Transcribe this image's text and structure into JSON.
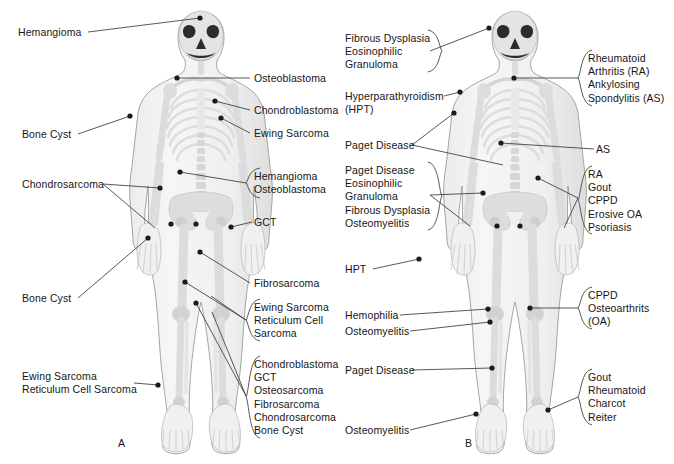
{
  "figure": {
    "panels": [
      {
        "id": "A",
        "letter": "A",
        "letter_pos": [
          118,
          437
        ],
        "subject": "Common sites of primary bone tumors",
        "labels": [
          {
            "name": "hemangioma-skull",
            "lines": [
              "Hemangioma"
            ],
            "x": 18,
            "y": 26,
            "align": "left",
            "brace": false,
            "leader": [
              [
                88,
                32
              ],
              [
                200,
                18
              ]
            ],
            "dots": [
              [
                200,
                18
              ]
            ]
          },
          {
            "name": "osteoblastoma-spine",
            "lines": [
              "Osteoblastoma"
            ],
            "x": 254,
            "y": 72,
            "align": "left",
            "brace": false,
            "leader": [
              [
                250,
                78
              ],
              [
                177,
                78
              ]
            ],
            "dots": [
              [
                177,
                78
              ]
            ]
          },
          {
            "name": "chondroblastoma-humerus",
            "lines": [
              "Chondroblastoma"
            ],
            "x": 254,
            "y": 104,
            "align": "left",
            "brace": false,
            "leader": [
              [
                250,
                110
              ],
              [
                215,
                101
              ]
            ],
            "dots": [
              [
                215,
                101
              ]
            ]
          },
          {
            "name": "ewing-sarcoma-humerus",
            "lines": [
              "Ewing Sarcoma"
            ],
            "x": 254,
            "y": 127,
            "align": "left",
            "brace": false,
            "leader": [
              [
                250,
                133
              ],
              [
                221,
                118
              ]
            ],
            "dots": [
              [
                221,
                118
              ]
            ]
          },
          {
            "name": "bone-cyst-proximal-humerus",
            "lines": [
              "Bone Cyst"
            ],
            "x": 22,
            "y": 128,
            "align": "left",
            "brace": false,
            "leader": [
              [
                78,
                134
              ],
              [
                130,
                116
              ]
            ],
            "dots": [
              [
                130,
                116
              ]
            ]
          },
          {
            "name": "hemangioma-osteoblastoma-spine",
            "lines": [
              "Hemangioma",
              "Osteoblastoma"
            ],
            "x": 254,
            "y": 170,
            "align": "left",
            "brace": true,
            "brace_box": [
              246,
              168,
              14,
              30
            ],
            "leader": [
              [
                246,
                183
              ],
              [
                180,
                172
              ]
            ],
            "dots": [
              [
                180,
                172
              ]
            ]
          },
          {
            "name": "chondrosarcoma-pelvis",
            "lines": [
              "Chondrosarcoma"
            ],
            "x": 22,
            "y": 178,
            "align": "left",
            "brace": false,
            "leader": [
              [
                103,
                184
              ],
              [
                160,
                188
              ]
            ],
            "dots": [
              [
                160,
                188
              ]
            ],
            "extra_leaders": [
              [
                [
                  103,
                  184
                ],
                [
                  155,
                  228
                ]
              ]
            ]
          },
          {
            "name": "gct-distal-radius",
            "lines": [
              "GCT"
            ],
            "x": 254,
            "y": 216,
            "align": "left",
            "brace": false,
            "leader": [
              [
                252,
                222
              ],
              [
                231,
                227
              ]
            ],
            "dots": [
              [
                231,
                227
              ]
            ]
          },
          {
            "name": "bone-cyst-femur",
            "lines": [
              "Bone Cyst"
            ],
            "x": 22,
            "y": 292,
            "align": "left",
            "brace": false,
            "leader": [
              [
                78,
                298
              ],
              [
                148,
                238
              ]
            ],
            "dots": [
              [
                148,
                238
              ]
            ]
          },
          {
            "name": "fibrosarcoma-femur",
            "lines": [
              "Fibrosarcoma"
            ],
            "x": 254,
            "y": 277,
            "align": "left",
            "brace": false,
            "leader": [
              [
                250,
                283
              ],
              [
                200,
                252
              ]
            ],
            "dots": [
              [
                200,
                252
              ]
            ]
          },
          {
            "name": "ewing-reticulum-femur",
            "lines": [
              "Ewing Sarcoma",
              "Reticulum Cell",
              "Sarcoma"
            ],
            "x": 254,
            "y": 301,
            "align": "left",
            "brace": true,
            "brace_box": [
              246,
              299,
              14,
              42
            ],
            "leader": [
              [
                246,
                320
              ],
              [
                185,
                282
              ]
            ],
            "dots": [
              [
                185,
                282
              ]
            ],
            "extra_leaders": [
              [
                [
                  246,
                  320
                ],
                [
                  211,
                  296
                ]
              ]
            ]
          },
          {
            "name": "ewing-reticulum-tibia",
            "lines": [
              "Ewing Sarcoma",
              "Reticulum Cell Sarcoma"
            ],
            "x": 22,
            "y": 370,
            "align": "left",
            "brace": false,
            "leader": [
              [
                134,
                383
              ],
              [
                158,
                385
              ]
            ],
            "dots": [
              [
                158,
                385
              ]
            ]
          },
          {
            "name": "knee-lesions-group",
            "lines": [
              "Chondroblastoma",
              "GCT",
              "Osteosarcoma",
              "Fibrosarcoma",
              "Chondrosarcoma",
              "Bone Cyst"
            ],
            "x": 254,
            "y": 358,
            "align": "left",
            "brace": true,
            "brace_box": [
              246,
              356,
              14,
              82
            ],
            "leader": [
              [
                246,
                396
              ],
              [
                196,
                303
              ]
            ],
            "dots": [
              [
                196,
                303
              ]
            ],
            "extra_leaders": [
              [
                [
                  246,
                  396
                ],
                [
                  212,
                  312
                ]
              ]
            ]
          }
        ],
        "extra_dots": [
          [
            171,
            224
          ],
          [
            196,
            224
          ]
        ]
      },
      {
        "id": "B",
        "letter": "B",
        "letter_pos": [
          465,
          437
        ],
        "subject": "Common sites of arthritis and metabolic bone disease",
        "labels": [
          {
            "name": "fibrous-dysplasia-eg-skull",
            "lines": [
              "Fibrous Dysplasia",
              "Eosinophilic",
              "Granuloma"
            ],
            "x": 345,
            "y": 32,
            "align": "left",
            "brace": true,
            "brace_box": [
              428,
              30,
              14,
              42
            ],
            "leader": [
              [
                430,
                51
              ],
              [
                489,
                28
              ]
            ],
            "dots": [
              [
                489,
                28
              ]
            ]
          },
          {
            "name": "rheumatoid-ankylosing-cervical",
            "lines": [
              "Rheumatoid",
              "Arthritis (RA)",
              "Ankylosing",
              "Spondylitis (AS)"
            ],
            "x": 588,
            "y": 52,
            "align": "left",
            "brace": true,
            "brace_box": [
              578,
              50,
              14,
              56
            ],
            "leader": [
              [
                578,
                78
              ],
              [
                514,
                78
              ]
            ],
            "dots": [
              [
                514,
                78
              ]
            ]
          },
          {
            "name": "hyperparathyroidism-shoulder",
            "lines": [
              "Hyperparathyroidism",
              "(HPT)"
            ],
            "x": 345,
            "y": 90,
            "align": "left",
            "brace": false,
            "leader": [
              [
                444,
                96
              ],
              [
                460,
                92
              ]
            ],
            "dots": [
              [
                460,
                92
              ]
            ]
          },
          {
            "name": "paget-disease-humerus-spine",
            "lines": [
              "Paget Disease"
            ],
            "x": 345,
            "y": 139,
            "align": "left",
            "brace": false,
            "leader": [
              [
                412,
                145
              ],
              [
                454,
                113
              ]
            ],
            "dots": [
              [
                454,
                113
              ]
            ],
            "extra_leaders": [
              [
                [
                  412,
                  145
                ],
                [
                  503,
                  165
                ]
              ]
            ]
          },
          {
            "name": "as-thoracic-spine",
            "lines": [
              "AS"
            ],
            "x": 596,
            "y": 143,
            "align": "left",
            "brace": false,
            "leader": [
              [
                594,
                149
              ],
              [
                501,
                143
              ]
            ],
            "dots": [
              [
                501,
                143
              ]
            ]
          },
          {
            "name": "paget-eg-fd-osteomyelitis-pelvis",
            "lines": [
              "Paget Disease",
              "Eosinophilic",
              "Granuloma",
              "Fibrous Dysplasia",
              "Osteomyelitis"
            ],
            "x": 345,
            "y": 164,
            "align": "left",
            "brace": true,
            "brace_box": [
              428,
              162,
              14,
              68
            ],
            "leader": [
              [
                430,
                195
              ],
              [
                483,
                193
              ]
            ],
            "dots": [
              [
                483,
                193
              ]
            ],
            "extra_leaders": [
              [
                [
                  430,
                  195
                ],
                [
                  470,
                  226
                ]
              ]
            ]
          },
          {
            "name": "ra-gout-cppd-hand-group",
            "lines": [
              "RA",
              "Gout",
              "CPPD",
              "Erosive OA",
              "Psoriasis"
            ],
            "x": 588,
            "y": 168,
            "align": "left",
            "brace": true,
            "brace_box": [
              578,
              166,
              14,
              68
            ],
            "leader": [
              [
                578,
                198
              ],
              [
                538,
                178
              ]
            ],
            "dots": [
              [
                538,
                178
              ]
            ],
            "extra_leaders": [
              [
                [
                  578,
                  198
                ],
                [
                  564,
                  228
                ]
              ]
            ]
          },
          {
            "name": "hpt-hand",
            "lines": [
              "HPT"
            ],
            "x": 345,
            "y": 263,
            "align": "left",
            "brace": false,
            "leader": [
              [
                373,
                269
              ],
              [
                419,
                259
              ]
            ],
            "dots": [
              [
                419,
                259
              ]
            ]
          },
          {
            "name": "cppd-osteoarthritis-knee",
            "lines": [
              "CPPD",
              "Osteoarthrits",
              "(OA)"
            ],
            "x": 588,
            "y": 289,
            "align": "left",
            "brace": true,
            "brace_box": [
              578,
              287,
              14,
              42
            ],
            "leader": [
              [
                578,
                308
              ],
              [
                530,
                308
              ]
            ],
            "dots": [
              [
                530,
                308
              ]
            ]
          },
          {
            "name": "hemophilia-knee",
            "lines": [
              "Hemophilia"
            ],
            "x": 345,
            "y": 309,
            "align": "left",
            "brace": false,
            "leader": [
              [
                400,
                315
              ],
              [
                488,
                309
              ]
            ],
            "dots": [
              [
                488,
                309
              ]
            ]
          },
          {
            "name": "osteomyelitis-knee",
            "lines": [
              "Osteomyelitis"
            ],
            "x": 345,
            "y": 325,
            "align": "left",
            "brace": false,
            "leader": [
              [
                410,
                331
              ],
              [
                490,
                322
              ]
            ],
            "dots": [
              [
                490,
                322
              ]
            ]
          },
          {
            "name": "paget-disease-tibia",
            "lines": [
              "Paget Disease"
            ],
            "x": 345,
            "y": 364,
            "align": "left",
            "brace": false,
            "leader": [
              [
                412,
                370
              ],
              [
                492,
                368
              ]
            ],
            "dots": [
              [
                492,
                368
              ]
            ]
          },
          {
            "name": "gout-rheumatoid-charcot-reiter-foot",
            "lines": [
              "Gout",
              "Rheumatoid",
              "Charcot",
              "Reiter"
            ],
            "x": 588,
            "y": 371,
            "align": "left",
            "brace": true,
            "brace_box": [
              578,
              369,
              14,
              56
            ],
            "leader": [
              [
                578,
                397
              ],
              [
                548,
                410
              ]
            ],
            "dots": [
              [
                548,
                410
              ]
            ]
          },
          {
            "name": "osteomyelitis-foot",
            "lines": [
              "Osteomyelitis"
            ],
            "x": 345,
            "y": 424,
            "align": "left",
            "brace": false,
            "leader": [
              [
                410,
                430
              ],
              [
                476,
                414
              ]
            ],
            "dots": [
              [
                476,
                414
              ]
            ]
          }
        ],
        "extra_dots": [
          [
            497,
            226
          ],
          [
            520,
            226
          ]
        ]
      }
    ]
  },
  "colors": {
    "background": "#ffffff",
    "text": "#161616",
    "leader_line": "#3a3a3a",
    "dot": "#1b1b1b",
    "body_fill": "#f2f2f2",
    "body_outline": "#9a9a9a",
    "bone_fill": "#e2e2e2",
    "bone_light": "#f7f7f7",
    "shadow": "#d8d8d8"
  }
}
